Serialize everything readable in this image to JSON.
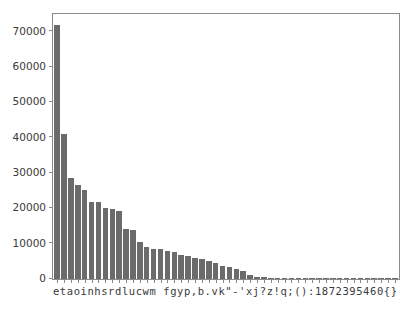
{
  "chart_data": {
    "type": "bar",
    "title": "",
    "subtitle": "",
    "xlabel": "",
    "ylabel": "",
    "legend": [],
    "grid": false,
    "legend_position": "none",
    "xlim": [
      -0.6,
      49.6
    ],
    "ylim": [
      0,
      75000
    ],
    "yticks": [
      0,
      10000,
      20000,
      30000,
      40000,
      50000,
      60000,
      70000
    ],
    "ytick_labels": [
      "0",
      "10000",
      "20000",
      "30000",
      "40000",
      "50000",
      "60000",
      "70000"
    ],
    "xtick_label_string": "etaoinhsrdlucwm fgyp,b.vk\"-'xj?z!q;():1872395460{}",
    "bar_color": "#6b6b6b",
    "axes_color": "#8a8a8a",
    "tick_label_color": "#3a3a3a",
    "background_color": "#ffffff",
    "categories": [
      "e",
      "t",
      "a",
      "o",
      "i",
      "n",
      "h",
      "s",
      "r",
      "d",
      "l",
      "u",
      "c",
      "w",
      "m",
      " ",
      "f",
      "g",
      "y",
      "p",
      ",",
      "b",
      ".",
      "v",
      "k",
      "\"",
      "-",
      "'",
      "x",
      "j",
      "?",
      "z",
      "!",
      "q",
      ";",
      "(",
      ")",
      ":",
      "1",
      "8",
      "7",
      "2",
      "3",
      "9",
      "5",
      "4",
      "6",
      "0",
      "{",
      "}"
    ],
    "values": [
      72000,
      41000,
      28700,
      26700,
      25100,
      21900,
      21700,
      20100,
      19900,
      19300,
      14100,
      13800,
      10500,
      9000,
      8500,
      8400,
      8000,
      7600,
      6800,
      6400,
      5900,
      5600,
      5200,
      4500,
      3800,
      3400,
      2900,
      2300,
      1200,
      700,
      520,
      420,
      360,
      300,
      250,
      210,
      180,
      150,
      130,
      110,
      95,
      80,
      70,
      60,
      50,
      45,
      38,
      30,
      22,
      15
    ]
  }
}
